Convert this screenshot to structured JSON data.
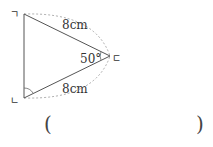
{
  "figure": {
    "type": "isosceles-triangle",
    "vertices": {
      "top_left": "ㄱ",
      "bottom_left": "ㄴ",
      "right": "ㄷ"
    },
    "side_top": "8cm",
    "side_bottom": "8cm",
    "angle_right": "50°"
  },
  "answer": {
    "open": "(",
    "close": ")"
  }
}
